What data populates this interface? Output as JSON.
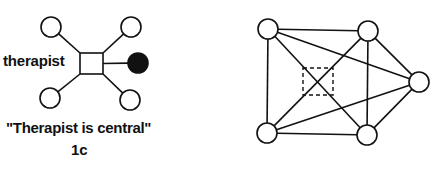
{
  "left_diagram": {
    "label": "therapist",
    "caption": "\"Therapist is central\"",
    "figure_id": "1c",
    "center_node": {
      "shape": "square",
      "x": 80,
      "y": 53,
      "w": 23,
      "h": 21
    },
    "nodes": [
      {
        "id": "top-left",
        "cx": 51,
        "cy": 27,
        "r": 10,
        "filled": false
      },
      {
        "id": "top-right",
        "cx": 131,
        "cy": 27,
        "r": 10,
        "filled": false
      },
      {
        "id": "right",
        "cx": 138,
        "cy": 63,
        "r": 10,
        "filled": true
      },
      {
        "id": "bottom-left",
        "cx": 50,
        "cy": 98,
        "r": 10,
        "filled": false
      },
      {
        "id": "bottom-right",
        "cx": 130,
        "cy": 100,
        "r": 10,
        "filled": false
      }
    ],
    "colors": {
      "stroke": "#111111",
      "fill_empty": "#ffffff",
      "fill_filled": "#111111"
    }
  },
  "right_diagram": {
    "center_marker": {
      "shape": "dashed-square",
      "x": 303,
      "y": 68,
      "w": 30,
      "h": 27
    },
    "nodes": [
      {
        "id": "top-left",
        "cx": 268,
        "cy": 29,
        "r": 10
      },
      {
        "id": "top-right",
        "cx": 368,
        "cy": 31,
        "r": 10
      },
      {
        "id": "right",
        "cx": 419,
        "cy": 82,
        "r": 10
      },
      {
        "id": "bottom-left",
        "cx": 267,
        "cy": 133,
        "r": 10
      },
      {
        "id": "bottom-right",
        "cx": 367,
        "cy": 135,
        "r": 10
      }
    ],
    "edges": [
      [
        "top-left",
        "top-right"
      ],
      [
        "top-left",
        "bottom-left"
      ],
      [
        "top-left",
        "right"
      ],
      [
        "top-left",
        "bottom-right"
      ],
      [
        "top-right",
        "bottom-right"
      ],
      [
        "top-right",
        "bottom-left"
      ],
      [
        "top-right",
        "right"
      ],
      [
        "bottom-left",
        "bottom-right"
      ],
      [
        "bottom-left",
        "right"
      ],
      [
        "bottom-right",
        "right"
      ]
    ]
  }
}
